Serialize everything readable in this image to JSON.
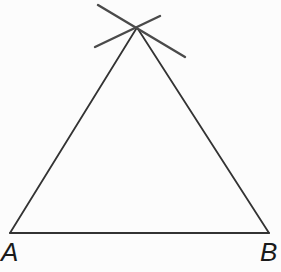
{
  "colors": {
    "background": "#fcfcfc",
    "triangle_stroke": "#333333",
    "mark_stroke": "#4a4a4a",
    "label_color": "#1a1a1a"
  },
  "diagram": {
    "type": "triangle-compass-construction",
    "vertices": {
      "A": {
        "x": 10,
        "y": 233
      },
      "B": {
        "x": 269,
        "y": 233
      },
      "apex": {
        "x": 137,
        "y": 27.5
      }
    },
    "construction_marks": [
      {
        "x1": 98,
        "y1": 5,
        "x2": 185,
        "y2": 57
      },
      {
        "x1": 95,
        "y1": 47,
        "x2": 160,
        "y2": 16
      }
    ],
    "labels": {
      "A": {
        "text": "A",
        "x": 1,
        "y": 261
      },
      "B": {
        "text": "B",
        "x": 260,
        "y": 261
      }
    }
  }
}
